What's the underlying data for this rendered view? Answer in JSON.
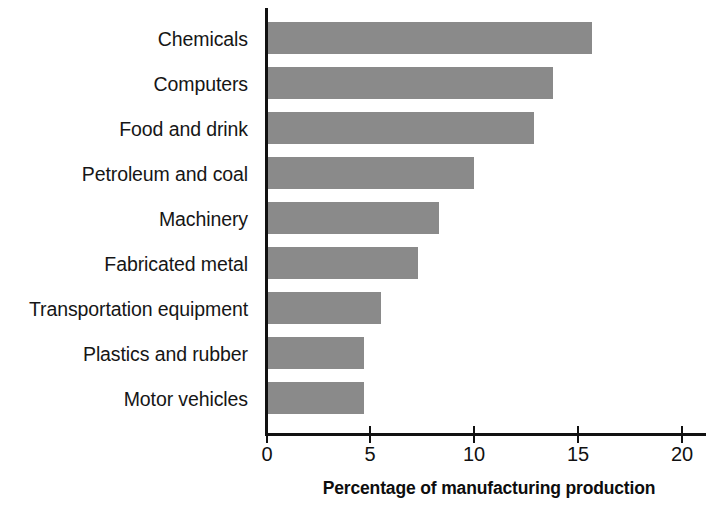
{
  "chart_data": {
    "type": "bar",
    "orientation": "horizontal",
    "title": "",
    "xlabel": "Percentage of manufacturing production",
    "ylabel": "",
    "categories": [
      "Chemicals",
      "Computers",
      "Food and drink",
      "Petroleum and coal",
      "Machinery",
      "Fabricated metal",
      "Transportation equipment",
      "Plastics and rubber",
      "Motor vehicles"
    ],
    "values": [
      15.7,
      13.8,
      12.9,
      10.0,
      8.3,
      7.3,
      5.5,
      4.7,
      4.7
    ],
    "xlim": [
      0,
      20
    ],
    "xticks": [
      0,
      5,
      10,
      15,
      20
    ],
    "xtick_labels": [
      "0",
      "5",
      "10",
      "15",
      "20"
    ],
    "grid": false,
    "legend": false,
    "bar_color": "#8a8a8a",
    "axis_color": "#111111",
    "background": "#ffffff"
  },
  "axis": {
    "x_title": "Percentage of manufacturing production",
    "tick_labels": [
      "0",
      "5",
      "10",
      "15",
      "20"
    ]
  },
  "categories": [
    {
      "label": "Chemicals",
      "value": 15.7
    },
    {
      "label": "Computers",
      "value": 13.8
    },
    {
      "label": "Food and drink",
      "value": 12.9
    },
    {
      "label": "Petroleum and coal",
      "value": 10.0
    },
    {
      "label": "Machinery",
      "value": 8.3
    },
    {
      "label": "Fabricated metal",
      "value": 7.3
    },
    {
      "label": "Transportation equipment",
      "value": 5.5
    },
    {
      "label": "Plastics and rubber",
      "value": 4.7
    },
    {
      "label": "Motor vehicles",
      "value": 4.7
    }
  ]
}
